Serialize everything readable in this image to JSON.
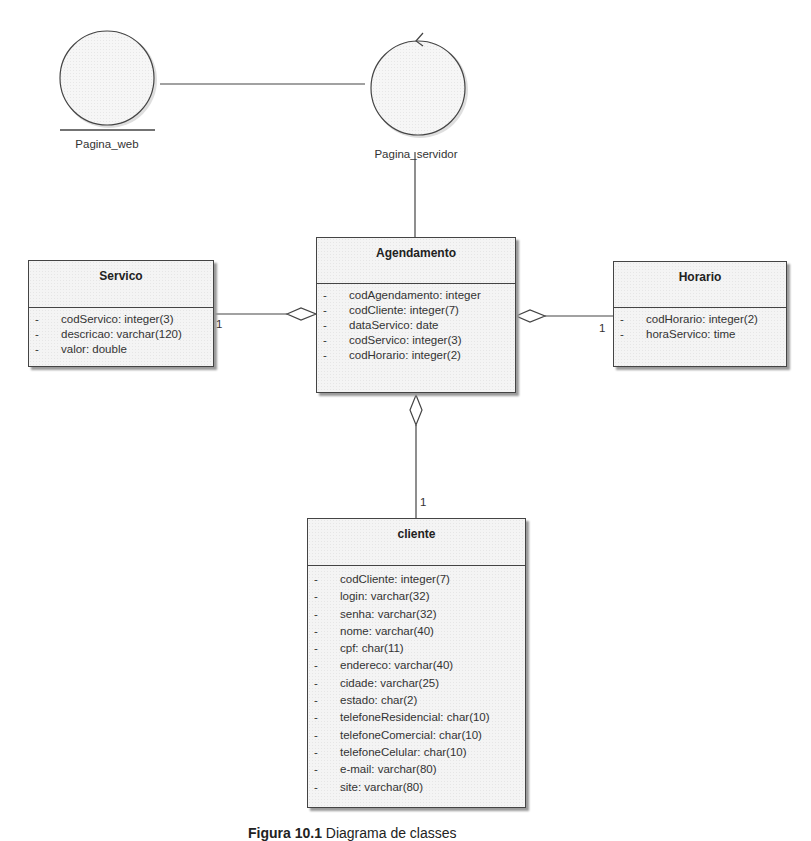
{
  "diagram": {
    "type": "uml-class-diagram",
    "actors": {
      "pagina_web": {
        "label": "Pagina_web",
        "stereotype": "boundary"
      },
      "pagina_servidor": {
        "label": "Pagina_servidor",
        "stereotype": "control"
      }
    },
    "classes": {
      "servico": {
        "name": "Servico",
        "attributes": [
          {
            "vis": "-",
            "text": "codServico:  integer(3)"
          },
          {
            "vis": "-",
            "text": "descricao:  varchar(120)"
          },
          {
            "vis": "-",
            "text": "valor:  double"
          }
        ]
      },
      "agendamento": {
        "name": "Agendamento",
        "attributes": [
          {
            "vis": "-",
            "text": "codAgendamento:  integer"
          },
          {
            "vis": "-",
            "text": "codCliente:  integer(7)"
          },
          {
            "vis": "-",
            "text": "dataServico:  date"
          },
          {
            "vis": "-",
            "text": "codServico:  integer(3)"
          },
          {
            "vis": "-",
            "text": "codHorario:  integer(2)"
          }
        ]
      },
      "horario": {
        "name": "Horario",
        "attributes": [
          {
            "vis": "-",
            "text": "codHorario:  integer(2)"
          },
          {
            "vis": "-",
            "text": "horaServico:  time"
          }
        ]
      },
      "cliente": {
        "name": "cliente",
        "attributes": [
          {
            "vis": "-",
            "text": "codCliente:  integer(7)"
          },
          {
            "vis": "-",
            "text": "login:  varchar(32)"
          },
          {
            "vis": "-",
            "text": "senha:  varchar(32)"
          },
          {
            "vis": "-",
            "text": "nome:  varchar(40)"
          },
          {
            "vis": "-",
            "text": "cpf:  char(11)"
          },
          {
            "vis": "-",
            "text": "endereco:  varchar(40)"
          },
          {
            "vis": "-",
            "text": "cidade:  varchar(25)"
          },
          {
            "vis": "-",
            "text": "estado:  char(2)"
          },
          {
            "vis": "-",
            "text": "telefoneResidencial:  char(10)"
          },
          {
            "vis": "-",
            "text": "telefoneComercial:  char(10)"
          },
          {
            "vis": "-",
            "text": "telefoneCelular:  char(10)"
          },
          {
            "vis": "-",
            "text": "e-mail:  varchar(80)"
          },
          {
            "vis": "-",
            "text": "site:  varchar(80)"
          }
        ]
      }
    },
    "relations": [
      {
        "from": "Pagina_web",
        "to": "Pagina_servidor",
        "kind": "association"
      },
      {
        "from": "Pagina_servidor",
        "to": "Agendamento",
        "kind": "association"
      },
      {
        "from": "Servico",
        "to": "Agendamento",
        "kind": "aggregation",
        "multiplicity": "1"
      },
      {
        "from": "Horario",
        "to": "Agendamento",
        "kind": "aggregation",
        "multiplicity": "1"
      },
      {
        "from": "cliente",
        "to": "Agendamento",
        "kind": "aggregation",
        "multiplicity": "1"
      }
    ],
    "multiplicities": {
      "servico": "1",
      "horario": "1",
      "cliente": "1"
    },
    "caption": {
      "figure": "Figura 10.1",
      "text": " Diagrama de classes"
    },
    "colors": {
      "line": "#444444",
      "fill": "#f4f4f4",
      "shadow": "#9a9a9a"
    }
  }
}
